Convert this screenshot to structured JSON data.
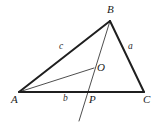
{
  "figure": {
    "type": "geometry-diagram",
    "width": 157,
    "height": 127,
    "background_color": "#ffffff",
    "stroke_color_thick": "#1f1f1f",
    "stroke_color_thin": "#3a3a3a",
    "label_color": "#1a1a1a",
    "vertices": [
      {
        "name": "A",
        "label": "A",
        "x": 19,
        "y": 92,
        "label_x": 11,
        "label_y": 94
      },
      {
        "name": "B",
        "label": "B",
        "x": 110,
        "y": 21,
        "label_x": 107,
        "label_y": 4
      },
      {
        "name": "C",
        "label": "C",
        "x": 144,
        "y": 92,
        "label_x": 143,
        "label_y": 94
      }
    ],
    "points": [
      {
        "name": "O",
        "label": "O",
        "x": 94,
        "y": 68,
        "label_x": 97,
        "label_y": 62
      },
      {
        "name": "P",
        "label": "P",
        "x": 88,
        "y": 92,
        "label_x": 89,
        "label_y": 94
      }
    ],
    "side_labels": [
      {
        "name": "side-c",
        "label": "c",
        "x": 59,
        "y": 42,
        "side": "AB"
      },
      {
        "name": "side-a",
        "label": "a",
        "x": 128,
        "y": 42,
        "side": "BC"
      },
      {
        "name": "side-b",
        "label": "b",
        "x": 63,
        "y": 94,
        "side": "AP"
      }
    ],
    "segments": [
      {
        "name": "side-AB",
        "from": "A",
        "to": "B",
        "x1": 19,
        "y1": 92,
        "x2": 110,
        "y2": 21,
        "weight": "thick"
      },
      {
        "name": "side-BC",
        "from": "B",
        "to": "C",
        "x1": 110,
        "y1": 21,
        "x2": 144,
        "y2": 92,
        "weight": "thick"
      },
      {
        "name": "side-AC",
        "from": "A",
        "to": "C",
        "x1": 19,
        "y1": 92,
        "x2": 144,
        "y2": 92,
        "weight": "thick"
      },
      {
        "name": "cevian-BP-extended",
        "from": "B",
        "to": "extension",
        "x1": 110,
        "y1": 21,
        "x2": 79,
        "y2": 121,
        "weight": "thin"
      },
      {
        "name": "segment-AO",
        "from": "A",
        "to": "O",
        "x1": 19,
        "y1": 92,
        "x2": 94,
        "y2": 68,
        "weight": "thin"
      }
    ]
  }
}
